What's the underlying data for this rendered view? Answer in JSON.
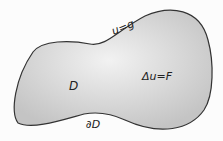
{
  "diagram": {
    "region_label": "D",
    "boundary_label": "∂D",
    "equation_label": "Δu=F",
    "boundary_condition_label": "u=g",
    "colors": {
      "fill_center": "#f2f2f2",
      "fill_edge": "#c4c4c4",
      "outline": "#333333"
    }
  }
}
